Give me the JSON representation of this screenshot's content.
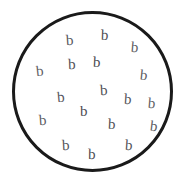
{
  "canvas": {
    "width": 181,
    "height": 183,
    "background_color": "#ffffff"
  },
  "shape": {
    "kind": "circle-outline",
    "stroke_color": "#1a1a1a",
    "fill_color": "none",
    "stroke_width": 3,
    "left": 12,
    "top": 11,
    "diameter": 161
  },
  "letters": {
    "glyph": "b",
    "count": 18,
    "color": "#55555a",
    "items": [
      {
        "char": "b",
        "x": 66,
        "y": 33,
        "size": 15,
        "rotate": -4,
        "color": "#56565c"
      },
      {
        "char": "b",
        "x": 101,
        "y": 28,
        "size": 15,
        "rotate": 2,
        "color": "#4e4e54"
      },
      {
        "char": "b",
        "x": 131,
        "y": 40,
        "size": 15,
        "rotate": 5,
        "color": "#5c5c62"
      },
      {
        "char": "b",
        "x": 68,
        "y": 57,
        "size": 15,
        "rotate": -2,
        "color": "#525258"
      },
      {
        "char": "b",
        "x": 93,
        "y": 55,
        "size": 15,
        "rotate": 3,
        "color": "#4a4a50"
      },
      {
        "char": "b",
        "x": 36,
        "y": 64,
        "size": 15,
        "rotate": -6,
        "color": "#5e5e64"
      },
      {
        "char": "b",
        "x": 140,
        "y": 68,
        "size": 15,
        "rotate": 6,
        "color": "#5a5a60"
      },
      {
        "char": "b",
        "x": 100,
        "y": 83,
        "size": 15,
        "rotate": -3,
        "color": "#4f4f55"
      },
      {
        "char": "b",
        "x": 57,
        "y": 90,
        "size": 15,
        "rotate": -5,
        "color": "#575760"
      },
      {
        "char": "b",
        "x": 124,
        "y": 92,
        "size": 15,
        "rotate": 4,
        "color": "#535359"
      },
      {
        "char": "b",
        "x": 80,
        "y": 104,
        "size": 15,
        "rotate": 0,
        "color": "#4d4d53"
      },
      {
        "char": "b",
        "x": 39,
        "y": 113,
        "size": 15,
        "rotate": -4,
        "color": "#5b5b61"
      },
      {
        "char": "b",
        "x": 108,
        "y": 117,
        "size": 15,
        "rotate": 3,
        "color": "#505056"
      },
      {
        "char": "b",
        "x": 150,
        "y": 119,
        "size": 15,
        "rotate": 7,
        "color": "#5d5d63"
      },
      {
        "char": "b",
        "x": 62,
        "y": 138,
        "size": 15,
        "rotate": -3,
        "color": "#545459"
      },
      {
        "char": "b",
        "x": 125,
        "y": 138,
        "size": 15,
        "rotate": 4,
        "color": "#515157"
      },
      {
        "char": "b",
        "x": 88,
        "y": 147,
        "size": 15,
        "rotate": 1,
        "color": "#4c4c52"
      },
      {
        "char": "b",
        "x": 148,
        "y": 96,
        "size": 15,
        "rotate": 5,
        "color": "#5f5f65"
      }
    ]
  }
}
